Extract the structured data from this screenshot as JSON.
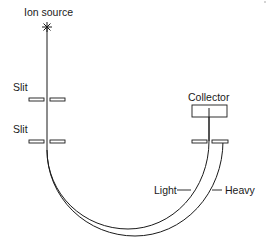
{
  "diagram": {
    "type": "mass-spectrometer-schematic",
    "labels": {
      "ion_source": "Ion source",
      "slit_upper": "Slit",
      "slit_lower": "Slit",
      "collector": "Collector",
      "light": "Light",
      "heavy": "Heavy"
    },
    "colors": {
      "stroke": "#1a1a1a",
      "background": "#ffffff"
    }
  }
}
